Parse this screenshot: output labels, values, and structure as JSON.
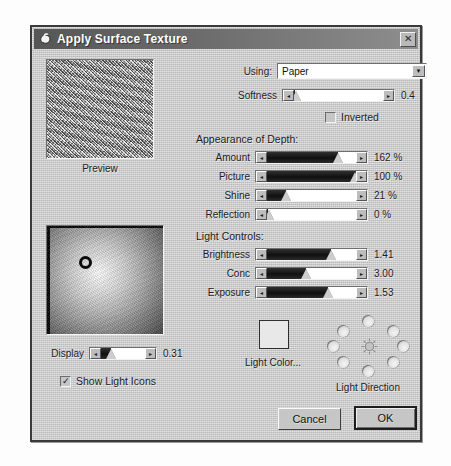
{
  "window": {
    "title": "Apply Surface Texture",
    "icon": "hand-texture-icon",
    "close_label": "✕"
  },
  "preview": {
    "label": "Preview",
    "caption_icon": "paper-texture-preview"
  },
  "sphere_preview": {
    "name": "light-sphere-preview",
    "handle_icon": "light-handle-icon"
  },
  "using": {
    "label": "Using:",
    "value": "Paper",
    "options": [
      "Paper"
    ],
    "arrow": "▼"
  },
  "softness": {
    "label": "Softness",
    "value": "0.4",
    "fill_pct": 1,
    "thumb_pct": 2
  },
  "inverted": {
    "label": "Inverted",
    "checked": false,
    "mark": ""
  },
  "appearance_of_depth": {
    "title": "Appearance of Depth:",
    "sliders": [
      {
        "label": "Amount",
        "value": "162 %",
        "fill_pct": 80,
        "thumb_pct": 80
      },
      {
        "label": "Picture",
        "value": "100 %",
        "fill_pct": 100,
        "thumb_pct": 99
      },
      {
        "label": "Shine",
        "value": "21 %",
        "fill_pct": 21,
        "thumb_pct": 21
      },
      {
        "label": "Reflection",
        "value": "0 %",
        "fill_pct": 1,
        "thumb_pct": 2
      }
    ]
  },
  "light_controls": {
    "title": "Light Controls:",
    "sliders": [
      {
        "label": "Brightness",
        "value": "1.41",
        "fill_pct": 72,
        "thumb_pct": 72
      },
      {
        "label": "Conc",
        "value": "3.00",
        "fill_pct": 44,
        "thumb_pct": 44
      },
      {
        "label": "Exposure",
        "value": "1.53",
        "fill_pct": 68,
        "thumb_pct": 68
      }
    ]
  },
  "display": {
    "label": "Display",
    "value": "0.31",
    "fill_pct": 22,
    "thumb_pct": 22
  },
  "show_light_icons": {
    "label": "Show Light Icons",
    "checked": true,
    "mark": "✓"
  },
  "light_color": {
    "label": "Light Color...",
    "swatch_color": "#e8e8e8"
  },
  "light_direction": {
    "label": "Light Direction",
    "sun_icon": "sun-burst-icon",
    "dots": 8
  },
  "buttons": {
    "cancel": "Cancel",
    "ok": "OK"
  },
  "slider_arrows": {
    "left": "◂",
    "right": "▸"
  }
}
